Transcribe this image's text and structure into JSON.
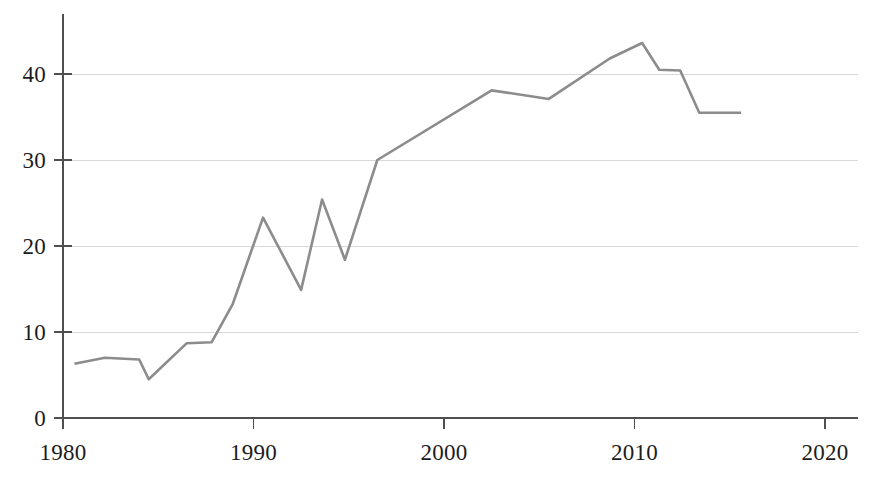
{
  "chart_data": {
    "type": "line",
    "title": "",
    "subtitle": "",
    "xlabel": "",
    "ylabel": "",
    "xlim": [
      1980,
      2020
    ],
    "ylim": [
      0,
      45
    ],
    "grid": "horizontal",
    "legend": "none",
    "line_color": "#8c8c8c",
    "grid_color": "#d9d9d9",
    "axis_color": "#4f4f4f",
    "x_ticks": [
      1980,
      1990,
      2000,
      2010,
      2020
    ],
    "x_tick_labels": [
      "1980",
      "1990",
      "2000",
      "2010",
      "2020"
    ],
    "y_ticks": [
      0,
      10,
      20,
      30,
      40
    ],
    "y_tick_labels": [
      "0",
      "10",
      "20",
      "30",
      "40"
    ],
    "y_gridlines": [
      10,
      20,
      30,
      40
    ],
    "series": [
      {
        "name": "series-1",
        "x": [
          1980.6,
          1982.2,
          1984.0,
          1984.5,
          1986.5,
          1987.8,
          1988.9,
          1990.5,
          1992.5,
          1993.6,
          1994.8,
          1996.5,
          2002.5,
          2005.5,
          2008.7,
          2010.4,
          2011.3,
          2012.4,
          2013.4,
          2015.6
        ],
        "y": [
          6.3,
          7.0,
          6.8,
          4.5,
          8.7,
          8.8,
          13.2,
          23.3,
          14.9,
          25.4,
          18.4,
          30.0,
          38.1,
          37.1,
          41.8,
          43.6,
          40.5,
          40.4,
          35.5,
          35.5
        ]
      }
    ]
  }
}
